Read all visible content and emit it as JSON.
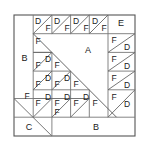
{
  "figure": {
    "colors": {
      "stroke": "#555555",
      "stroke_light": "#888888",
      "background": "#ffffff",
      "text": "#1a1a1a"
    },
    "outer_square": {
      "x": 14,
      "y": 15,
      "size": 121
    },
    "grid": {
      "columns": 6,
      "rows": 6,
      "cell": 18.7
    },
    "pieces": [
      {
        "id": "p-A",
        "label": "A",
        "x": 88,
        "y": 51,
        "type": "large-triangle"
      },
      {
        "id": "p-B1",
        "label": "B",
        "x": 24.5,
        "y": 59,
        "type": "left-rectangle"
      },
      {
        "id": "p-B2",
        "label": "B",
        "x": 96,
        "y": 130,
        "type": "bottom-rectangle"
      },
      {
        "id": "p-C",
        "label": "C",
        "x": 33,
        "y": 130,
        "type": "bottom-left-triangle"
      },
      {
        "id": "p-E",
        "label": "E",
        "x": 122,
        "y": 24,
        "type": "corner-square"
      },
      {
        "id": "t-D-r0c1",
        "label": "D",
        "x": 38,
        "y": 21
      },
      {
        "id": "t-F-r0c1",
        "label": "F",
        "x": 49,
        "y": 30
      },
      {
        "id": "t-D-r0c2",
        "label": "D",
        "x": 57,
        "y": 21
      },
      {
        "id": "t-F-r0c2",
        "label": "F",
        "x": 68,
        "y": 30
      },
      {
        "id": "t-D-r0c3",
        "label": "D",
        "x": 76,
        "y": 21
      },
      {
        "id": "t-F-r0c3",
        "label": "F",
        "x": 87,
        "y": 30
      },
      {
        "id": "t-D-r0c4",
        "label": "D",
        "x": 94,
        "y": 21
      },
      {
        "id": "t-F-r0c4",
        "label": "F",
        "x": 105,
        "y": 30
      },
      {
        "id": "t-F-r1c5",
        "label": "F",
        "x": 115,
        "y": 40
      },
      {
        "id": "t-D-r1c5",
        "label": "D",
        "x": 127,
        "y": 49
      },
      {
        "id": "t-F-r2c5",
        "label": "F",
        "x": 115,
        "y": 59
      },
      {
        "id": "t-D-r2c5",
        "label": "D",
        "x": 127,
        "y": 68
      },
      {
        "id": "t-F-r3c5",
        "label": "F",
        "x": 115,
        "y": 77
      },
      {
        "id": "t-D-r3c5",
        "label": "D",
        "x": 127,
        "y": 86
      },
      {
        "id": "t-F-r4c5",
        "label": "F",
        "x": 115,
        "y": 96
      },
      {
        "id": "t-D-r4c5",
        "label": "D",
        "x": 127,
        "y": 105
      },
      {
        "id": "t-F-r1c1",
        "label": "F",
        "x": 38,
        "y": 41
      },
      {
        "id": "t-D-r2c1",
        "label": "D",
        "x": 49,
        "y": 53
      },
      {
        "id": "t-F-r2c1",
        "label": "F",
        "x": 38,
        "y": 62
      },
      {
        "id": "t-F-r2c2",
        "label": "F",
        "x": 57,
        "y": 62
      },
      {
        "id": "t-D-r3c1",
        "label": "D",
        "x": 49,
        "y": 72
      },
      {
        "id": "t-F-r3c1",
        "label": "F",
        "x": 38,
        "y": 81
      },
      {
        "id": "t-D-r3c2",
        "label": "D",
        "x": 68,
        "y": 72
      },
      {
        "id": "t-F-r3c2",
        "label": "F",
        "x": 57,
        "y": 81
      },
      {
        "id": "t-F-r3c3",
        "label": "F",
        "x": 76,
        "y": 81
      },
      {
        "id": "t-F-r4c0",
        "label": "F",
        "x": 28,
        "y": 91
      },
      {
        "id": "t-D-r4c1",
        "label": "D",
        "x": 49,
        "y": 91
      },
      {
        "id": "t-F-r4c1",
        "label": "F",
        "x": 38,
        "y": 100
      },
      {
        "id": "t-D-r4c2",
        "label": "D",
        "x": 68,
        "y": 91
      },
      {
        "id": "t-F-r4c2",
        "label": "F",
        "x": 57,
        "y": 100
      },
      {
        "id": "t-D-r4c3",
        "label": "D",
        "x": 87,
        "y": 91
      },
      {
        "id": "t-F-r4c3",
        "label": "F",
        "x": 76,
        "y": 100
      },
      {
        "id": "t-F-r4c4",
        "label": "F",
        "x": 95,
        "y": 100
      },
      {
        "id": "t-F-r5c1",
        "label": "F",
        "x": 57,
        "y": 110
      }
    ]
  }
}
